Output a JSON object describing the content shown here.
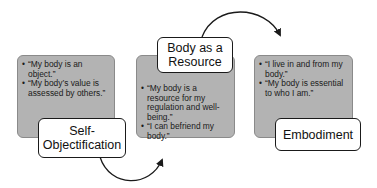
{
  "stages": [
    {
      "label": "Self-Objectification",
      "label_lines": [
        "Self-",
        "Objectification"
      ],
      "bullets": [
        "“My body is an object.”",
        "“My body’s value is assessed by others.”"
      ]
    },
    {
      "label": "Body as a Resource",
      "label_lines": [
        "Body as a",
        "Resource"
      ],
      "bullets": [
        "“My body is a resource for my regulation and well-being.”",
        "“I can befriend my body.”"
      ]
    },
    {
      "label": "Embodiment",
      "label_lines": [
        "Embodiment"
      ],
      "bullets": [
        "“I live in and from my body.”",
        "“My body is essential to who I am.”"
      ]
    }
  ],
  "colors": {
    "card_fill": "#b3b3b3",
    "label_fill": "#ffffff",
    "stroke": "#1a1a1a"
  }
}
